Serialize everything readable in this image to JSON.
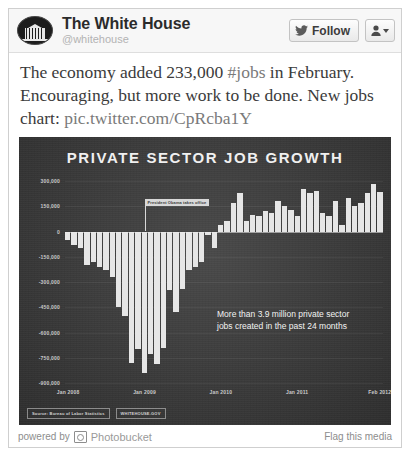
{
  "header": {
    "avatar_icon": "white-house-seal-avatar",
    "account_name": "The White House",
    "handle": "@whitehouse",
    "follow_label": "Follow",
    "follow_icon": "twitter-bird-icon",
    "user_menu_icon": "person-icon",
    "caret_icon": "chevron-down-icon"
  },
  "tweet": {
    "line1_a": "The economy added 233,000 ",
    "hashtag": "#jobs",
    "line1_b": " in February.",
    "line2": "Encouraging, but more work to be done. New jobs",
    "line3_label": "chart: ",
    "link": "pic.twitter.com/CpRcba1Y"
  },
  "footer": {
    "powered_by": "powered by",
    "brand": "Photobucket",
    "brand_icon": "photobucket-icon",
    "flag_label": "Flag this media"
  },
  "chart_data": {
    "type": "bar",
    "title": "PRIVATE SECTOR JOB GROWTH",
    "xlabel": "",
    "ylabel": "",
    "ylim": [
      -900000,
      300000
    ],
    "grid": true,
    "legend": false,
    "yticks": [
      300000,
      150000,
      0,
      -150000,
      -300000,
      -450000,
      -600000,
      -750000,
      -900000
    ],
    "ytick_labels": [
      "300,000",
      "150,000",
      "0",
      "-150,000",
      "-300,000",
      "-450,000",
      "-600,000",
      "-750,000",
      "-900,000"
    ],
    "xtick_labels": [
      "Jan 2008",
      "Jan 2009",
      "Jan 2010",
      "Jan 2011",
      "Feb 2012"
    ],
    "xtick_indices": [
      0,
      12,
      24,
      36,
      49
    ],
    "annotations": [
      {
        "name": "obama-inauguration-marker",
        "text": "President Obama takes office",
        "at_index": 12
      },
      {
        "name": "jobs-created-callout",
        "line1": "More than 3.9 million private sector",
        "line2": "jobs created in the past 24 months"
      }
    ],
    "source_note": "Source: Bureau of Labor Statistics",
    "brand_note": "WHITEHOUSE.GOV",
    "categories": [
      "Jan 2008",
      "Feb 2008",
      "Mar 2008",
      "Apr 2008",
      "May 2008",
      "Jun 2008",
      "Jul 2008",
      "Aug 2008",
      "Sep 2008",
      "Oct 2008",
      "Nov 2008",
      "Dec 2008",
      "Jan 2009",
      "Feb 2009",
      "Mar 2009",
      "Apr 2009",
      "May 2009",
      "Jun 2009",
      "Jul 2009",
      "Aug 2009",
      "Sep 2009",
      "Oct 2009",
      "Nov 2009",
      "Dec 2009",
      "Jan 2010",
      "Feb 2010",
      "Mar 2010",
      "Apr 2010",
      "May 2010",
      "Jun 2010",
      "Jul 2010",
      "Aug 2010",
      "Sep 2010",
      "Oct 2010",
      "Nov 2010",
      "Dec 2010",
      "Jan 2011",
      "Feb 2011",
      "Mar 2011",
      "Apr 2011",
      "May 2011",
      "Jun 2011",
      "Jul 2011",
      "Aug 2011",
      "Sep 2011",
      "Oct 2011",
      "Nov 2011",
      "Dec 2011",
      "Jan 2012",
      "Feb 2012"
    ],
    "values": [
      -50000,
      -80000,
      -100000,
      -200000,
      -180000,
      -210000,
      -230000,
      -270000,
      -450000,
      -500000,
      -780000,
      -700000,
      -840000,
      -730000,
      -790000,
      -690000,
      -350000,
      -480000,
      -340000,
      -230000,
      -210000,
      -180000,
      -20000,
      -100000,
      40000,
      60000,
      170000,
      230000,
      60000,
      100000,
      90000,
      120000,
      110000,
      180000,
      150000,
      130000,
      90000,
      250000,
      230000,
      240000,
      110000,
      90000,
      180000,
      40000,
      200000,
      150000,
      170000,
      230000,
      280000,
      233000
    ]
  }
}
